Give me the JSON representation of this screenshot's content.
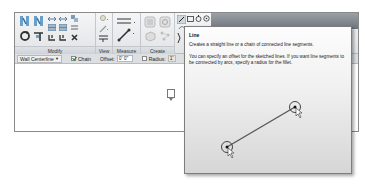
{
  "ribbon": {
    "panels": [
      {
        "id": "modify",
        "label": "Modify"
      },
      {
        "id": "view",
        "label": "View"
      },
      {
        "id": "measure",
        "label": "Measure"
      },
      {
        "id": "create",
        "label": "Create"
      },
      {
        "id": "draw",
        "label": ""
      }
    ],
    "draw_tools": [
      "line-tool",
      "rectangle-tool",
      "inscribed-polygon-tool",
      "circle-tool",
      "arc-tool",
      "dropdown"
    ]
  },
  "options_bar": {
    "placement": "Wall Centerline",
    "chain_label": "Chain",
    "chain_checked": true,
    "offset_label": "Offset:",
    "offset_value": "0' 0\"",
    "radius_label": "Radius:",
    "radius_checked": false,
    "radius_value": "1'"
  },
  "tooltip": {
    "title": "Line",
    "description": "Creates a straight line or a chain of connected line segments.",
    "extended": "You can specify an offset for the sketched lines. If you want line segments to be connected by arcs, specify a radius for the fillet."
  },
  "colors": {
    "ribbon_bg": "#e8eaec",
    "ribbon_dark": "#7a8087",
    "tooltip_bg": "#f1f1f1",
    "line_color": "#555555"
  }
}
